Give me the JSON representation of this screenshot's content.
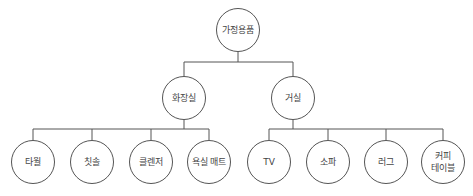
{
  "diagram": {
    "type": "tree",
    "root": {
      "id": "root",
      "label": "가정용품"
    },
    "level2": [
      {
        "id": "bathroom",
        "label": "화장실"
      },
      {
        "id": "livingroom",
        "label": "거실"
      }
    ],
    "level3": [
      {
        "id": "towel",
        "parent": "bathroom",
        "label": "타월"
      },
      {
        "id": "toothbrush",
        "parent": "bathroom",
        "label": "칫솔"
      },
      {
        "id": "cleanser",
        "parent": "bathroom",
        "label": "클렌저"
      },
      {
        "id": "bathmat",
        "parent": "bathroom",
        "label": "욕실 매트"
      },
      {
        "id": "tv",
        "parent": "livingroom",
        "label": "TV"
      },
      {
        "id": "sofa",
        "parent": "livingroom",
        "label": "소파"
      },
      {
        "id": "rug",
        "parent": "livingroom",
        "label": "러그"
      },
      {
        "id": "coffeetable",
        "parent": "livingroom",
        "label": "커피\n테이블"
      }
    ]
  },
  "colors": {
    "stroke": "#555555",
    "text": "#444444",
    "background": "#ffffff"
  }
}
